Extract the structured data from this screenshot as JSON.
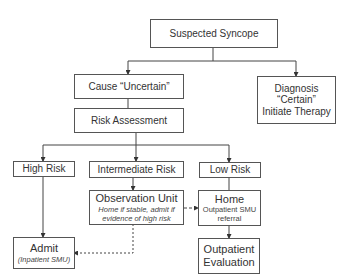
{
  "diagram": {
    "nodes": {
      "suspected_syncope": {
        "label": "Suspected Syncope"
      },
      "cause_uncertain": {
        "label": "Cause “Uncertain”"
      },
      "diagnosis_certain": {
        "line1": "Diagnosis",
        "line2": "“Certain”",
        "line3": "Initiate Therapy"
      },
      "risk_assessment": {
        "label": "Risk Assessment"
      },
      "high_risk": {
        "label": "High Risk"
      },
      "intermediate_risk": {
        "label": "Intermediate Risk"
      },
      "low_risk": {
        "label": "Low Risk"
      },
      "observation_unit": {
        "label": "Observation Unit",
        "note_line1": "Home if stable, admit if",
        "note_line2": "evidence of high risk"
      },
      "home": {
        "label": "Home",
        "note_line1": "Outpatient SMU",
        "note_line2": "referral"
      },
      "admit": {
        "label": "Admit",
        "note": "(Inpatient SMU)"
      },
      "outpatient_evaluation": {
        "line1": "Outpatient",
        "line2": "Evaluation"
      }
    },
    "edges": [
      {
        "from": "suspected_syncope",
        "to": "cause_uncertain",
        "style": "solid"
      },
      {
        "from": "suspected_syncope",
        "to": "diagnosis_certain",
        "style": "solid"
      },
      {
        "from": "cause_uncertain",
        "to": "risk_assessment",
        "style": "solid"
      },
      {
        "from": "risk_assessment",
        "to": "high_risk",
        "style": "solid"
      },
      {
        "from": "risk_assessment",
        "to": "intermediate_risk",
        "style": "solid"
      },
      {
        "from": "risk_assessment",
        "to": "low_risk",
        "style": "solid"
      },
      {
        "from": "high_risk",
        "to": "admit",
        "style": "solid"
      },
      {
        "from": "intermediate_risk",
        "to": "observation_unit",
        "style": "solid"
      },
      {
        "from": "low_risk",
        "to": "home",
        "style": "solid"
      },
      {
        "from": "home",
        "to": "outpatient_evaluation",
        "style": "solid"
      },
      {
        "from": "observation_unit",
        "to": "home",
        "style": "dashed"
      },
      {
        "from": "observation_unit",
        "to": "admit",
        "style": "dashed"
      }
    ],
    "colors": {
      "line": "#444444",
      "border": "#555555",
      "text": "#333333"
    }
  }
}
